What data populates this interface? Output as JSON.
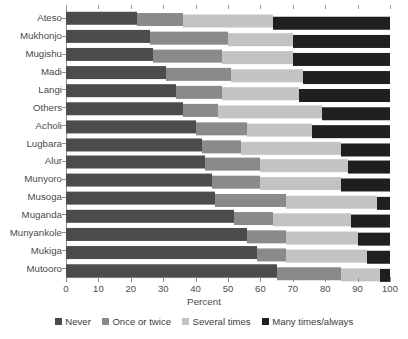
{
  "chart_data": {
    "type": "bar",
    "orientation": "horizontal",
    "stacked": true,
    "stacked_mode": "percent",
    "title": "",
    "xlabel": "Percent",
    "ylabel": "",
    "xlim": [
      0,
      100
    ],
    "xticks": [
      0,
      10,
      20,
      30,
      40,
      50,
      60,
      70,
      80,
      90,
      100
    ],
    "grid": false,
    "legend_position": "bottom",
    "categories": [
      "Ateso",
      "Mukhonjo",
      "Mugishu",
      "Madi",
      "Langi",
      "Others",
      "Acholi",
      "Lugbara",
      "Alur",
      "Munyoro",
      "Musoga",
      "Muganda",
      "Munyankole",
      "Mukiga",
      "Mutooro"
    ],
    "series": [
      {
        "name": "Never",
        "color": "#4c4c4c",
        "values": [
          22,
          26,
          27,
          31,
          34,
          36,
          40,
          42,
          43,
          45,
          46,
          52,
          56,
          59,
          65
        ]
      },
      {
        "name": "Once or twice",
        "color": "#8a8a8a",
        "values": [
          14,
          24,
          21,
          20,
          14,
          11,
          16,
          12,
          17,
          15,
          22,
          12,
          12,
          9,
          20
        ]
      },
      {
        "name": "Several times",
        "color": "#c3c3c3",
        "values": [
          28,
          20,
          22,
          22,
          24,
          32,
          20,
          31,
          27,
          25,
          28,
          24,
          22,
          25,
          12
        ]
      },
      {
        "name": "Many times/always",
        "color": "#1f1f1f",
        "values": [
          36,
          30,
          30,
          27,
          28,
          21,
          24,
          15,
          13,
          15,
          4,
          12,
          10,
          7,
          3
        ]
      }
    ]
  },
  "legend": {
    "items": [
      {
        "label": "Never",
        "color": "#4c4c4c"
      },
      {
        "label": "Once or twice",
        "color": "#8a8a8a"
      },
      {
        "label": "Several times",
        "color": "#c3c3c3"
      },
      {
        "label": "Many times/always",
        "color": "#1f1f1f"
      }
    ]
  },
  "axis": {
    "x_title": "Percent",
    "x_ticks": [
      "0",
      "10",
      "20",
      "30",
      "40",
      "50",
      "60",
      "70",
      "80",
      "90",
      "100"
    ]
  },
  "title_clipped": ""
}
